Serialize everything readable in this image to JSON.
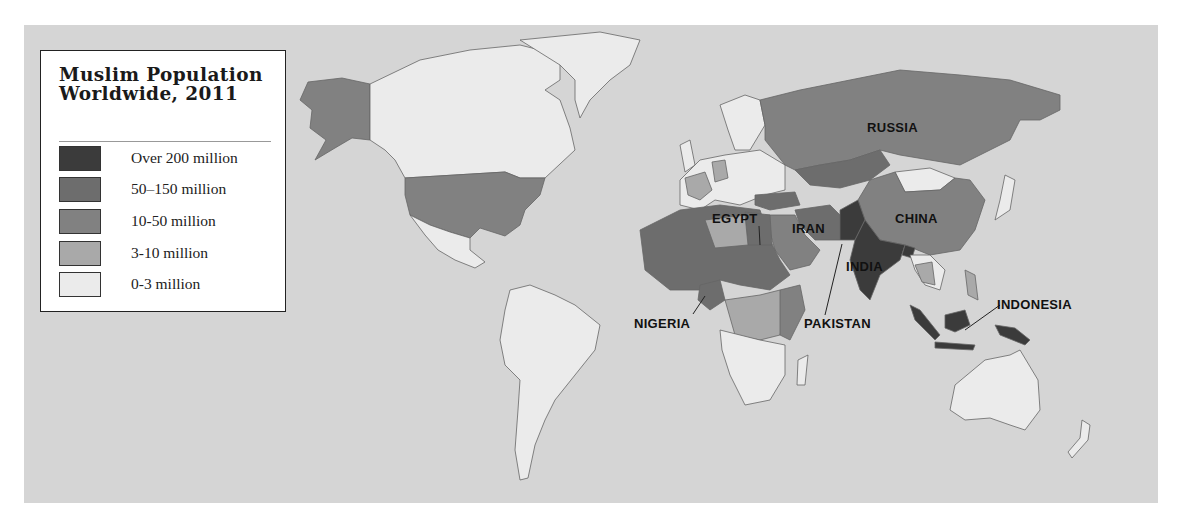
{
  "legend": {
    "title_line1": "Muslim Population",
    "title_line2": "Worldwide, 2011",
    "items": [
      {
        "label": "Over 200 million",
        "color": "#3b3b3b"
      },
      {
        "label": "50–150 million",
        "color": "#6d6d6d"
      },
      {
        "label": "10-50 million",
        "color": "#818181"
      },
      {
        "label": "3-10 million",
        "color": "#a9a9a9"
      },
      {
        "label": "0-3 million",
        "color": "#ebebeb"
      }
    ]
  },
  "colors": {
    "ocean": "#d5d5d5",
    "border": "#555555"
  },
  "labels": {
    "russia": "RUSSIA",
    "china": "CHINA",
    "egypt": "EGYPT",
    "iran": "IRAN",
    "india": "INDIA",
    "pakistan": "PAKISTAN",
    "nigeria": "NIGERIA",
    "indonesia": "INDONESIA"
  }
}
